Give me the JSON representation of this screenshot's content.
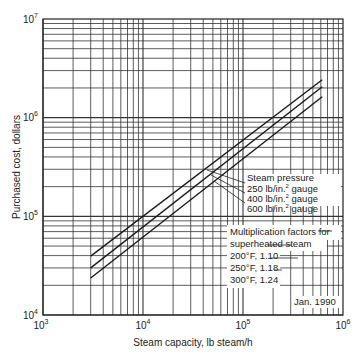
{
  "chart_data": {
    "type": "line",
    "title": "",
    "xlabel": "Steam capacity, lb steam/h",
    "ylabel": "Purchased cost, dollars",
    "xscale": "log",
    "yscale": "log",
    "xlim": [
      1000,
      1000000
    ],
    "ylim": [
      10000,
      10000000
    ],
    "x_ticks": [
      {
        "base": "10",
        "exp": "3",
        "value": 1000
      },
      {
        "base": "10",
        "exp": "4",
        "value": 10000
      },
      {
        "base": "10",
        "exp": "5",
        "value": 100000
      },
      {
        "base": "10",
        "exp": "6",
        "value": 1000000
      }
    ],
    "y_ticks": [
      {
        "base": "10",
        "exp": "4",
        "value": 10000
      },
      {
        "base": "10",
        "exp": "5",
        "value": 100000
      },
      {
        "base": "10",
        "exp": "6",
        "value": 1000000
      },
      {
        "base": "10",
        "exp": "7",
        "value": 10000000
      }
    ],
    "grid": true,
    "x": [
      3000,
      620000
    ],
    "series": [
      {
        "name": "600 lb/in.2 gauge",
        "values": [
          39500,
          2420000
        ]
      },
      {
        "name": "400 lb/in.2 gauge",
        "values": [
          30000,
          2060000
        ]
      },
      {
        "name": "250 lb/in.2 gauge",
        "values": [
          23700,
          1630000
        ]
      }
    ],
    "annotations": {
      "legend_title": "Steam pressure",
      "legend_items": [
        "250 lb/in.2 gauge",
        "400 lb/in.2 gauge",
        "600 lb/in.2 gauge"
      ],
      "factors_title_1": "Multiplication factors for",
      "factors_title_2": "superheated steam",
      "factors": [
        "200°F, 1.10",
        "250°F, 1.18",
        "300°F, 1.24"
      ],
      "date": "Jan. 1990"
    }
  },
  "labels": {
    "ylabel": "Purchased cost, dollars",
    "xlabel": "Steam capacity, lb steam/h",
    "legend_title": "Steam pressure",
    "p250": "250 lb/in.",
    "p400": "400 lb/in.",
    "p600": "600 lb/in.",
    "sup2": "2",
    "gauge": " gauge",
    "factors_title_1": "Multiplication factors for",
    "factors_title_2": "superheated steam",
    "f200": "200°F, 1.10",
    "f250": "250°F, 1.18",
    "f300": "300°F, 1.24",
    "date": "Jan. 1990",
    "ten": "10",
    "e3": "3",
    "e4": "4",
    "e5": "5",
    "e6": "6",
    "e7": "7"
  }
}
